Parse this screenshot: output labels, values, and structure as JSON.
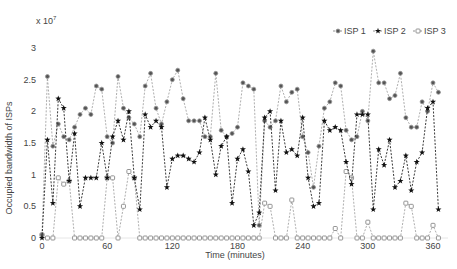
{
  "chart_data": {
    "type": "line",
    "title": "",
    "xlabel": "Time (minutes)",
    "ylabel": "Occupied bandwidth of ISPs",
    "y_multiplier": "x 10^7",
    "xlim": [
      0,
      370
    ],
    "ylim": [
      0,
      3
    ],
    "xticks": [
      0,
      60,
      120,
      180,
      240,
      300,
      360
    ],
    "yticks": [
      0,
      0.5,
      1,
      1.5,
      2,
      2.5,
      3
    ],
    "grid": false,
    "legend_position": "top-right",
    "x": [
      0,
      5,
      10,
      15,
      20,
      25,
      30,
      35,
      40,
      45,
      50,
      55,
      60,
      65,
      70,
      75,
      80,
      85,
      90,
      95,
      100,
      105,
      110,
      115,
      120,
      125,
      130,
      135,
      140,
      145,
      150,
      155,
      160,
      165,
      170,
      175,
      180,
      185,
      190,
      195,
      200,
      205,
      210,
      215,
      220,
      225,
      230,
      235,
      240,
      245,
      250,
      255,
      260,
      265,
      270,
      275,
      280,
      285,
      290,
      295,
      300,
      305,
      310,
      315,
      320,
      325,
      330,
      335,
      340,
      345,
      350,
      355,
      360,
      365
    ],
    "series": [
      {
        "name": "ISP 1",
        "marker": "circle-filled",
        "color": "#888888",
        "values": [
          0.05,
          2.55,
          1.45,
          1.8,
          1.6,
          1.55,
          1.75,
          1.95,
          2.05,
          1.95,
          2.4,
          2.35,
          1.6,
          1.5,
          2.55,
          2.05,
          1.9,
          1.8,
          1.6,
          2.4,
          2.6,
          2.05,
          1.8,
          2.15,
          2.5,
          2.65,
          2.2,
          1.85,
          1.85,
          1.85,
          1.6,
          1.6,
          2.6,
          1.7,
          1.6,
          1.65,
          1.75,
          2.45,
          2.4,
          2.35,
          0.2,
          1.85,
          1.75,
          1.85,
          2.4,
          2.15,
          2.3,
          2.35,
          1.6,
          1.35,
          0.8,
          1.45,
          2.05,
          2.15,
          2.45,
          2.4,
          1.7,
          1.55,
          1.6,
          2.0,
          1.85,
          2.95,
          2.45,
          2.45,
          2.2,
          2.25,
          2.6,
          1.9,
          1.75,
          1.75,
          2.15,
          2.0,
          2.45,
          2.3
        ]
      },
      {
        "name": "ISP 2",
        "marker": "star-filled",
        "color": "#111111",
        "values": [
          0.0,
          1.55,
          0.55,
          2.2,
          2.05,
          0.9,
          1.65,
          0.5,
          0.95,
          0.95,
          0.95,
          1.5,
          0.95,
          1.6,
          1.85,
          1.55,
          2.0,
          0.95,
          0.45,
          1.95,
          1.75,
          1.85,
          1.75,
          0.8,
          1.25,
          1.3,
          1.3,
          1.25,
          1.2,
          1.35,
          1.9,
          1.55,
          1.0,
          1.45,
          1.6,
          0.55,
          1.25,
          1.4,
          1.05,
          0.2,
          0.4,
          1.9,
          2.0,
          0.75,
          1.85,
          1.35,
          1.4,
          1.3,
          1.9,
          0.95,
          0.5,
          0.55,
          1.85,
          1.7,
          1.75,
          1.7,
          1.2,
          0.85,
          1.95,
          1.95,
          1.95,
          0.45,
          1.4,
          1.15,
          1.55,
          0.8,
          0.9,
          1.3,
          0.75,
          1.2,
          1.35,
          2.05,
          2.15,
          0.45
        ]
      },
      {
        "name": "ISP 3",
        "marker": "square-open",
        "color": "#777777",
        "values": [
          0.05,
          0.0,
          0.0,
          0.95,
          0.85,
          0.9,
          0.0,
          0.0,
          0.0,
          0.0,
          0.0,
          0.0,
          0.95,
          0.95,
          0.0,
          0.5,
          1.05,
          0.95,
          0.0,
          0.0,
          0.0,
          0.0,
          0.0,
          0.0,
          0.0,
          0.0,
          0.0,
          0.0,
          0.0,
          0.0,
          0.0,
          0.0,
          0.0,
          0.0,
          0.0,
          0.0,
          0.0,
          0.0,
          0.0,
          0.0,
          0.0,
          0.55,
          0.5,
          0.0,
          0.0,
          0.0,
          0.6,
          0.0,
          0.0,
          0.0,
          0.0,
          0.0,
          0.0,
          0.0,
          0.15,
          0.0,
          1.05,
          0.95,
          0.0,
          0.0,
          0.25,
          0.0,
          0.0,
          0.0,
          0.0,
          0.0,
          0.0,
          0.55,
          0.5,
          0.0,
          0.0,
          0.0,
          0.2,
          0.0
        ]
      }
    ]
  }
}
